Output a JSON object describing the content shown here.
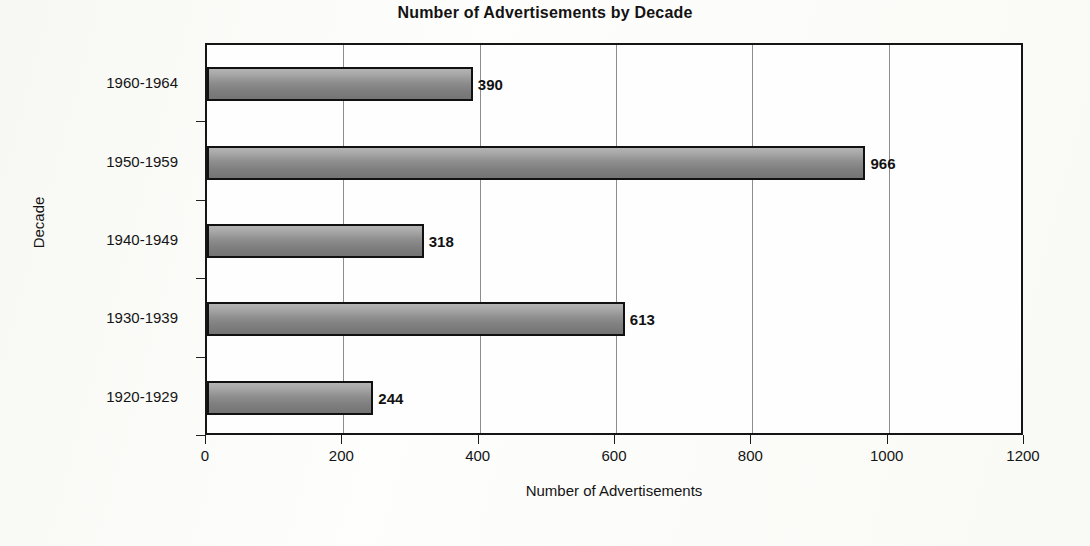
{
  "chart_data": {
    "type": "bar",
    "orientation": "horizontal",
    "title": "Number of Advertisements by Decade",
    "xlabel": "Number of Advertisements",
    "ylabel": "Decade",
    "categories": [
      "1920-1929",
      "1930-1939",
      "1940-1949",
      "1950-1959",
      "1960-1964"
    ],
    "values": [
      244,
      613,
      318,
      966,
      390
    ],
    "data_labels": [
      "244",
      "613",
      "318",
      "966",
      "390"
    ],
    "xlim": [
      0,
      1200
    ],
    "xticks": [
      0,
      200,
      400,
      600,
      800,
      1000,
      1200
    ],
    "xtick_labels": [
      "0",
      "200",
      "400",
      "600",
      "800",
      "1000",
      "1200"
    ],
    "grid": "vertical",
    "legend": "none",
    "bar_fill": "#8e8e8e",
    "bar_border": "#111111",
    "plot_border": "#151515",
    "gridline_color": "#8d8d8d",
    "background": "#fefefe",
    "display_order_top_to_bottom": [
      "1960-1964",
      "1950-1959",
      "1940-1949",
      "1930-1939",
      "1920-1929"
    ]
  }
}
